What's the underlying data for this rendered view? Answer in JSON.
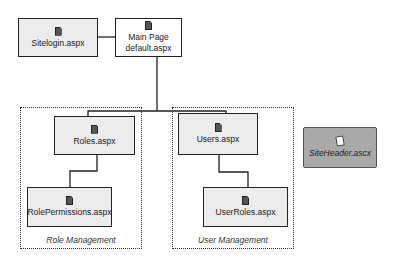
{
  "diagram": {
    "nodes": {
      "sitelogin": {
        "label": "Sitelogin.aspx",
        "icon": "document-icon"
      },
      "main": {
        "title": "Main Page",
        "label": "default.aspx",
        "icon": "document-icon"
      },
      "roles": {
        "label": "Roles.aspx",
        "icon": "document-icon"
      },
      "rolepermissions": {
        "label": "RolePermissions.aspx",
        "icon": "document-icon"
      },
      "users": {
        "label": "Users.aspx",
        "icon": "document-icon"
      },
      "userroles": {
        "label": "UserRoles.aspx",
        "icon": "document-icon"
      },
      "siteheader": {
        "label": "SiteHeader.ascx",
        "icon": "user-control-icon"
      }
    },
    "groups": {
      "role_management": {
        "label": "Role Management"
      },
      "user_management": {
        "label": "User Management"
      }
    },
    "edges": [
      [
        "sitelogin",
        "main"
      ],
      [
        "main",
        "roles"
      ],
      [
        "main",
        "users"
      ],
      [
        "roles",
        "rolepermissions"
      ],
      [
        "users",
        "userroles"
      ]
    ],
    "colors": {
      "node_fill": "#ececec",
      "main_fill": "#ffffff",
      "control_fill": "#a9a9a9",
      "line": "#222222"
    }
  }
}
